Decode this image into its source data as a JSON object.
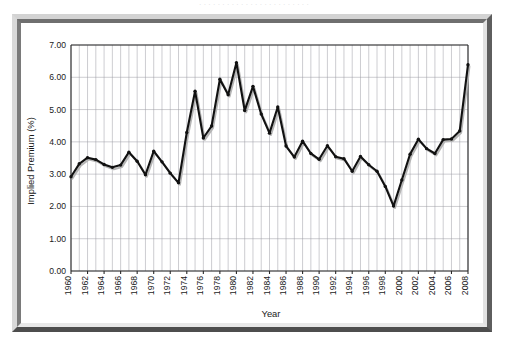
{
  "caption_sliver": "· · · · · · · · · · · · · · · · · · · · · · · ·",
  "figure": {
    "frame_style": "beveled-gray-3d",
    "background_color": "#ffffff",
    "frame_color": "#b9b9b9",
    "series_color": "#111111",
    "grid_color": "#9a9aa2",
    "axis_color": "#2a2a2a"
  },
  "chart_data": {
    "type": "line",
    "title": "",
    "xlabel": "Year",
    "ylabel": "Implied Premium (%)",
    "xlim": [
      1960,
      2008
    ],
    "ylim": [
      0.0,
      7.0
    ],
    "grid": true,
    "legend": null,
    "y_ticks": [
      "0.00",
      "1.00",
      "2.00",
      "3.00",
      "4.00",
      "5.00",
      "6.00",
      "7.00"
    ],
    "y_tick_values": [
      0,
      1,
      2,
      3,
      4,
      5,
      6,
      7
    ],
    "x_ticks": [
      "1960",
      "1962",
      "1964",
      "1966",
      "1968",
      "1970",
      "1972",
      "1974",
      "1976",
      "1978",
      "1980",
      "1982",
      "1984",
      "1986",
      "1988",
      "1990",
      "1992",
      "1994",
      "1996",
      "1998",
      "2000",
      "2002",
      "2004",
      "2006",
      "2008"
    ],
    "x_tick_rotation": 90,
    "marker": "round",
    "series": [
      {
        "name": "Implied Premium",
        "x": [
          1960,
          1961,
          1962,
          1963,
          1964,
          1965,
          1966,
          1967,
          1968,
          1969,
          1970,
          1971,
          1972,
          1973,
          1974,
          1975,
          1976,
          1977,
          1978,
          1979,
          1980,
          1981,
          1982,
          1983,
          1984,
          1985,
          1986,
          1987,
          1988,
          1989,
          1990,
          1991,
          1992,
          1993,
          1994,
          1995,
          1996,
          1997,
          1998,
          1999,
          2000,
          2001,
          2002,
          2003,
          2004,
          2005,
          2006,
          2007,
          2008
        ],
        "values": [
          2.92,
          3.32,
          3.51,
          3.45,
          3.3,
          3.21,
          3.28,
          3.68,
          3.4,
          2.98,
          3.71,
          3.38,
          3.03,
          2.73,
          4.29,
          5.57,
          4.12,
          4.49,
          5.94,
          5.46,
          6.45,
          4.97,
          5.72,
          4.86,
          4.27,
          5.08,
          3.87,
          3.53,
          4.02,
          3.64,
          3.46,
          3.88,
          3.54,
          3.48,
          3.09,
          3.55,
          3.29,
          3.09,
          2.62,
          2.01,
          2.82,
          3.62,
          4.08,
          3.79,
          3.64,
          4.07,
          4.09,
          4.34,
          6.39
        ]
      }
    ]
  }
}
